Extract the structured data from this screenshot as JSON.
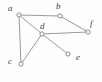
{
  "figure": {
    "type": "undirected-graph-diagram",
    "width": 102,
    "height": 82,
    "background_color": "#fefefe",
    "edge_color": "#9a9a9a",
    "vertex_stroke_color": "#8c8c8c",
    "vertex_fill_color": "#ffffff",
    "label_color": "#3c3c3c"
  },
  "chart_data": {
    "type": "diagram",
    "title": "",
    "vertices": [
      {
        "id": "a",
        "label": "a",
        "x": 19,
        "y": 15,
        "label_x": 8,
        "label_y": 4
      },
      {
        "id": "b",
        "label": "b",
        "x": 60,
        "y": 16,
        "label_x": 56,
        "label_y": 2
      },
      {
        "id": "c",
        "label": "c",
        "x": 21,
        "y": 64,
        "label_x": 8,
        "label_y": 57
      },
      {
        "id": "d",
        "label": "d",
        "x": 42,
        "y": 34,
        "label_x": 40,
        "label_y": 22
      },
      {
        "id": "e",
        "label": "e",
        "x": 68,
        "y": 54,
        "label_x": 76,
        "label_y": 53
      },
      {
        "id": "f",
        "label": "f",
        "x": 88,
        "y": 32,
        "label_x": 90,
        "label_y": 19
      }
    ],
    "edges": [
      {
        "from": "a",
        "to": "b"
      },
      {
        "from": "a",
        "to": "c"
      },
      {
        "from": "a",
        "to": "d"
      },
      {
        "from": "b",
        "to": "f"
      },
      {
        "from": "c",
        "to": "d"
      },
      {
        "from": "d",
        "to": "f"
      },
      {
        "from": "d",
        "to": "e"
      }
    ],
    "vertex_count": 6,
    "edge_count": 7
  }
}
